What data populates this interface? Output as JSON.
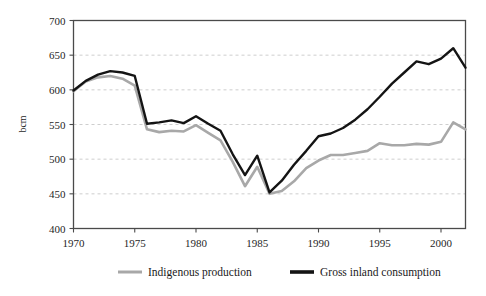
{
  "chart_data": {
    "type": "line",
    "title": "",
    "subtitle": "",
    "xlabel": "",
    "ylabel": "bcm",
    "xlim": [
      1970,
      2002
    ],
    "ylim": [
      400,
      700
    ],
    "y_ticks": [
      400,
      450,
      500,
      550,
      600,
      650,
      700
    ],
    "x_ticks": [
      1970,
      1975,
      1980,
      1985,
      1990,
      1995,
      2000
    ],
    "x_tick_labels": [
      "1970",
      "1975",
      "1980",
      "1985",
      "1990",
      "1995",
      "2000"
    ],
    "y_tick_labels": [
      "400",
      "450",
      "500",
      "550",
      "600",
      "650",
      "700"
    ],
    "grid": "horizontal-dashed",
    "legend_position": "bottom-center",
    "x": [
      1970,
      1971,
      1972,
      1973,
      1974,
      1975,
      1976,
      1977,
      1978,
      1979,
      1980,
      1981,
      1982,
      1983,
      1984,
      1985,
      1986,
      1987,
      1988,
      1989,
      1990,
      1991,
      1992,
      1993,
      1994,
      1995,
      1996,
      1997,
      1998,
      1999,
      2000,
      2001,
      2002
    ],
    "series": [
      {
        "name": "Indigenous production",
        "color": "#a8a8a8",
        "values": [
          598,
          612,
          618,
          620,
          616,
          606,
          543,
          539,
          541,
          540,
          549,
          538,
          527,
          496,
          461,
          489,
          450,
          454,
          468,
          487,
          498,
          506,
          506,
          509,
          512,
          523,
          520,
          520,
          522,
          521,
          525,
          553,
          543
        ]
      },
      {
        "name": "Gross inland consumption",
        "color": "#141414",
        "values": [
          599,
          613,
          622,
          627,
          625,
          620,
          551,
          553,
          556,
          552,
          562,
          551,
          541,
          507,
          477,
          505,
          452,
          469,
          492,
          512,
          533,
          537,
          545,
          557,
          572,
          590,
          609,
          625,
          641,
          637,
          645,
          660,
          632
        ]
      }
    ]
  },
  "legend": {
    "items": [
      {
        "label": "Indigenous production",
        "color": "#a8a8a8",
        "swatch_width": 3.0
      },
      {
        "label": "Gross inland consumption",
        "color": "#141414",
        "swatch_width": 3.6
      }
    ]
  },
  "colors": {
    "background": "#ffffff",
    "frame": "#4a4a4a",
    "gridline": "#b9b9b9",
    "text": "#1a1a1a",
    "indigenous_production": "#a8a8a8",
    "gross_inland_consumption": "#141414"
  }
}
